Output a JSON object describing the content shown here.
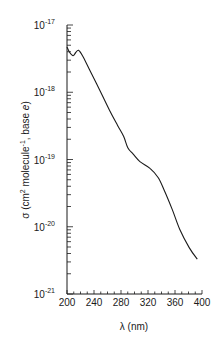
{
  "chart_data": {
    "type": "line",
    "title": "",
    "xlabel": "λ (nm)",
    "ylabel": "σ (cm² molecule⁻¹, base e)",
    "ylabel_parts": {
      "prefix": "σ (cm",
      "sup1": "2",
      "mid": " molecule",
      "sup2": "-1",
      "suffix": ", base ",
      "italic": "e",
      "close": ")"
    },
    "xlim": [
      200,
      400
    ],
    "ylim": [
      1e-21,
      1e-17
    ],
    "yscale": "log",
    "grid": false,
    "legend": null,
    "x_ticks": [
      200,
      240,
      280,
      320,
      360,
      400
    ],
    "y_ticks": [
      {
        "base": "10",
        "exp": "-17",
        "value": 1e-17
      },
      {
        "base": "10",
        "exp": "-18",
        "value": 1e-18
      },
      {
        "base": "10",
        "exp": "-19",
        "value": 1e-19
      },
      {
        "base": "10",
        "exp": "-20",
        "value": 1e-20
      },
      {
        "base": "10",
        "exp": "-21",
        "value": 1e-21
      }
    ],
    "series": [
      {
        "name": "cross section",
        "color": "#1a1a1a",
        "x": [
          200,
          204,
          209,
          213,
          217,
          223,
          233,
          248,
          263,
          275,
          284,
          290,
          298,
          308,
          323,
          335,
          344,
          356,
          367,
          381,
          393
        ],
        "y": [
          4.7e-18,
          3.9e-18,
          3.5e-18,
          3.9e-18,
          4.2e-18,
          3.5e-18,
          2.2e-18,
          1.1e-18,
          5.4e-19,
          3.2e-19,
          2.2e-19,
          1.5e-19,
          1.2e-19,
          9.3e-20,
          7.4e-20,
          5.4e-20,
          3.5e-20,
          1.8e-20,
          9.2e-21,
          4.9e-21,
          3.3e-21
        ]
      }
    ]
  },
  "colors": {
    "line": "#1a1a1a",
    "axis": "#1a1a1a",
    "background": "#ffffff"
  }
}
